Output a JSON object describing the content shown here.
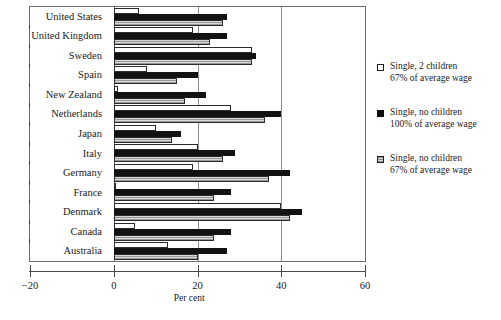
{
  "chart_data": {
    "type": "bar",
    "orientation": "horizontal",
    "title": "",
    "xlabel": "Per cent",
    "ylabel": "",
    "xlim": [
      -20,
      60
    ],
    "xticks": [
      -20,
      0,
      20,
      40,
      60
    ],
    "xtick_labels": [
      "−20",
      "0",
      "20",
      "40",
      "60"
    ],
    "grid": true,
    "legend_position": "right",
    "categories": [
      "United States",
      "United Kingdom",
      "Sweden",
      "Spain",
      "New Zealand",
      "Netherlands",
      "Japan",
      "Italy",
      "Germany",
      "France",
      "Denmark",
      "Canada",
      "Australia"
    ],
    "series": [
      {
        "name": "Single, 2 children 67% of average wage",
        "name_line1": "Single, 2 children",
        "name_line2": "67% of average wage",
        "style": "white",
        "values": [
          6,
          19,
          33,
          8,
          1,
          28,
          10,
          20,
          19,
          0,
          40,
          5,
          13
        ]
      },
      {
        "name": "Single, no children 100% of average wage",
        "name_line1": "Single, no children",
        "name_line2": "100% of average wage",
        "style": "black",
        "values": [
          27,
          27,
          34,
          20,
          22,
          40,
          16,
          29,
          42,
          28,
          45,
          28,
          27
        ]
      },
      {
        "name": "Single, no children 67% of average wage",
        "name_line1": "Single, no children",
        "name_line2": "67% of average wage",
        "style": "gray",
        "values": [
          26,
          23,
          33,
          15,
          17,
          36,
          14,
          26,
          37,
          24,
          42,
          24,
          20
        ]
      }
    ]
  },
  "colors": {
    "series_white": "#ffffff",
    "series_black": "#121212",
    "series_gray": "#9a9a9a",
    "frame": "#6e6e6e",
    "axis": "#4a4a4a",
    "grid": "#8e8e8e",
    "text": "#1a1a1a",
    "background": "#ffffff"
  }
}
